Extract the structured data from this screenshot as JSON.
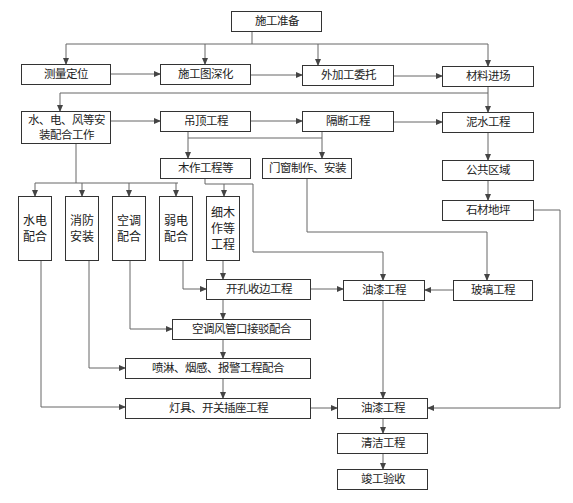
{
  "diagram": {
    "type": "flowchart",
    "language": "zh-CN",
    "colors": {
      "line": "#666666",
      "border": "#333333",
      "text": "#222222",
      "background": "#ffffff"
    },
    "nodes": {
      "prep": "施工准备",
      "survey": "测量定位",
      "drawing": "施工图深化",
      "outsource": "外加工委托",
      "material": "材料进场",
      "mep": "水、电、风等安装配合工作",
      "ceiling": "吊顶工程",
      "partition": "隔断工程",
      "masonry": "泥水工程",
      "carpentry": "木作工程等",
      "doors": "门窗制作、安装",
      "public": "公共区域",
      "stone": "石材地坪",
      "plumbing": "水电配合",
      "fire": "消防安装",
      "hvac": "空调配合",
      "lowvolt": "弱电配合",
      "finewood": "细木作等工程",
      "opening": "开孔收边工程",
      "paint1": "油漆工程",
      "glass": "玻璃工程",
      "duct": "空调风管口接驳配合",
      "sprinkler": "喷淋、烟感、报警工程配合",
      "lights": "灯具、开关插座工程",
      "paint2": "油漆工程",
      "cleaning": "清洁工程",
      "acceptance": "竣工验收"
    },
    "edges": [
      [
        "施工准备",
        "测量定位"
      ],
      [
        "施工准备",
        "施工图深化"
      ],
      [
        "施工准备",
        "外加工委托"
      ],
      [
        "施工准备",
        "材料进场"
      ],
      [
        "测量定位",
        "施工图深化"
      ],
      [
        "施工图深化",
        "外加工委托"
      ],
      [
        "外加工委托",
        "材料进场"
      ],
      [
        "材料进场",
        "水、电、风等安装配合工作"
      ],
      [
        "材料进场",
        "泥水工程"
      ],
      [
        "水、电、风等安装配合工作",
        "吊顶工程"
      ],
      [
        "吊顶工程",
        "隔断工程"
      ],
      [
        "隔断工程",
        "泥水工程"
      ],
      [
        "吊顶工程",
        "木作工程等"
      ],
      [
        "隔断工程",
        "门窗制作、安装"
      ],
      [
        "隔断工程",
        "木作工程等"
      ],
      [
        "泥水工程",
        "公共区域"
      ],
      [
        "公共区域",
        "石材地坪"
      ],
      [
        "水、电、风等安装配合工作",
        "水电配合"
      ],
      [
        "水、电、风等安装配合工作",
        "消防安装"
      ],
      [
        "水、电、风等安装配合工作",
        "空调配合"
      ],
      [
        "水、电、风等安装配合工作",
        "弱电配合"
      ],
      [
        "木作工程等",
        "细木作等工程"
      ],
      [
        "木作工程等",
        "油漆工程"
      ],
      [
        "细木作等工程",
        "开孔收边工程"
      ],
      [
        "弱电配合",
        "开孔收边工程"
      ],
      [
        "开孔收边工程",
        "油漆工程"
      ],
      [
        "玻璃工程",
        "油漆工程"
      ],
      [
        "门窗制作、安装",
        "玻璃工程"
      ],
      [
        "开孔收边工程",
        "空调风管口接驳配合"
      ],
      [
        "空调配合",
        "空调风管口接驳配合"
      ],
      [
        "空调风管口接驳配合",
        "喷淋、烟感、报警工程配合"
      ],
      [
        "消防安装",
        "喷淋、烟感、报警工程配合"
      ],
      [
        "喷淋、烟感、报警工程配合",
        "灯具、开关插座工程"
      ],
      [
        "水电配合",
        "灯具、开关插座工程"
      ],
      [
        "灯具、开关插座工程",
        "油漆工程(2)"
      ],
      [
        "油漆工程",
        "油漆工程(2)"
      ],
      [
        "石材地坪",
        "油漆工程(2)"
      ],
      [
        "油漆工程(2)",
        "清洁工程"
      ],
      [
        "清洁工程",
        "竣工验收"
      ]
    ]
  }
}
